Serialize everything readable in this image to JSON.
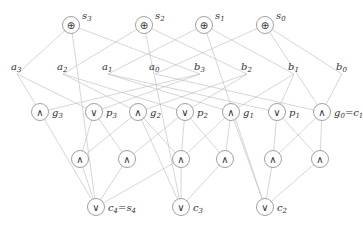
{
  "diagram": {
    "colors": {
      "wire": "#bbbbbb",
      "gate_stroke": "#888888",
      "text": "#333333"
    },
    "gate_symbols": {
      "xor": "⊕",
      "and": "∧",
      "or": "∨"
    },
    "xor_gates": [
      {
        "id": "s3",
        "x": 71,
        "y": 25,
        "label": "s",
        "sub": "3"
      },
      {
        "id": "s2",
        "x": 144,
        "y": 25,
        "label": "s",
        "sub": "2"
      },
      {
        "id": "s1",
        "x": 204,
        "y": 25,
        "label": "s",
        "sub": "1"
      },
      {
        "id": "s0",
        "x": 265,
        "y": 25,
        "label": "s",
        "sub": "0"
      }
    ],
    "inputs": [
      {
        "id": "a3",
        "x": 17,
        "y": 70,
        "label": "a",
        "sub": "3"
      },
      {
        "id": "a2",
        "x": 63,
        "y": 70,
        "label": "a",
        "sub": "2"
      },
      {
        "id": "a1",
        "x": 108,
        "y": 70,
        "label": "a",
        "sub": "1"
      },
      {
        "id": "a0",
        "x": 155,
        "y": 70,
        "label": "a",
        "sub": "0"
      },
      {
        "id": "b3",
        "x": 200,
        "y": 70,
        "label": "b",
        "sub": "3"
      },
      {
        "id": "b2",
        "x": 247,
        "y": 70,
        "label": "b",
        "sub": "2"
      },
      {
        "id": "b1",
        "x": 294,
        "y": 70,
        "label": "b",
        "sub": "1"
      },
      {
        "id": "b0",
        "x": 342,
        "y": 70,
        "label": "b",
        "sub": "0"
      }
    ],
    "gp_gates": [
      {
        "id": "g3",
        "type": "and",
        "x": 40,
        "y": 112,
        "label": "g",
        "sub": "3"
      },
      {
        "id": "p3",
        "type": "or",
        "x": 94,
        "y": 112,
        "label": "p",
        "sub": "3"
      },
      {
        "id": "g2",
        "type": "and",
        "x": 138,
        "y": 112,
        "label": "g",
        "sub": "2"
      },
      {
        "id": "p2",
        "type": "or",
        "x": 185,
        "y": 112,
        "label": "p",
        "sub": "2"
      },
      {
        "id": "g1",
        "type": "and",
        "x": 231,
        "y": 112,
        "label": "g",
        "sub": "1"
      },
      {
        "id": "p1",
        "type": "or",
        "x": 277,
        "y": 112,
        "label": "p",
        "sub": "1"
      },
      {
        "id": "g0",
        "type": "and",
        "x": 322,
        "y": 112,
        "label": "g",
        "sub": "0",
        "suffix": "=c",
        "suffix_sub": "1"
      }
    ],
    "and_row": [
      {
        "id": "n1",
        "type": "and",
        "x": 80,
        "y": 159
      },
      {
        "id": "n2",
        "type": "and",
        "x": 127,
        "y": 159
      },
      {
        "id": "n3",
        "type": "and",
        "x": 181,
        "y": 159
      },
      {
        "id": "n4",
        "type": "and",
        "x": 225,
        "y": 159
      },
      {
        "id": "n5",
        "type": "and",
        "x": 273,
        "y": 159
      },
      {
        "id": "n6",
        "type": "and",
        "x": 320,
        "y": 159
      }
    ],
    "carry_gates": [
      {
        "id": "c4",
        "type": "or",
        "x": 96,
        "y": 207,
        "label": "c",
        "sub": "4",
        "suffix": "=s",
        "suffix_sub": "4"
      },
      {
        "id": "c3",
        "type": "or",
        "x": 181,
        "y": 207,
        "label": "c",
        "sub": "3"
      },
      {
        "id": "c2",
        "type": "or",
        "x": 265,
        "y": 207,
        "label": "c",
        "sub": "2"
      }
    ],
    "wires": [
      [
        "a3",
        "s3"
      ],
      [
        "b3",
        "s3"
      ],
      [
        "a2",
        "s2"
      ],
      [
        "b2",
        "s2"
      ],
      [
        "a1",
        "s1"
      ],
      [
        "b1",
        "s1"
      ],
      [
        "a0",
        "s0"
      ],
      [
        "b0",
        "s0"
      ],
      [
        "c4",
        "s3"
      ],
      [
        "c3",
        "s2"
      ],
      [
        "c2",
        "s1"
      ],
      [
        "g0",
        "s0"
      ],
      [
        "a3",
        "g3"
      ],
      [
        "a3",
        "p3"
      ],
      [
        "b3",
        "g3"
      ],
      [
        "b3",
        "p3"
      ],
      [
        "a2",
        "g2"
      ],
      [
        "a2",
        "p2"
      ],
      [
        "b2",
        "g2"
      ],
      [
        "b2",
        "p2"
      ],
      [
        "a1",
        "g1"
      ],
      [
        "a1",
        "p1"
      ],
      [
        "b1",
        "g1"
      ],
      [
        "b1",
        "p1"
      ],
      [
        "a0",
        "g0"
      ],
      [
        "b0",
        "g0"
      ],
      [
        "p3",
        "n1"
      ],
      [
        "g2",
        "n1"
      ],
      [
        "p3",
        "n2"
      ],
      [
        "p2",
        "n2"
      ],
      [
        "g2",
        "n3"
      ],
      [
        "p2",
        "n3"
      ],
      [
        "g1",
        "n3"
      ],
      [
        "p2",
        "n4"
      ],
      [
        "g1",
        "n4"
      ],
      [
        "p1",
        "n5"
      ],
      [
        "g0",
        "n5"
      ],
      [
        "p1",
        "n6"
      ],
      [
        "g0",
        "n6"
      ],
      [
        "g3",
        "c4"
      ],
      [
        "n1",
        "c4"
      ],
      [
        "n2",
        "c4"
      ],
      [
        "n3",
        "c4"
      ],
      [
        "g2",
        "c3"
      ],
      [
        "n3",
        "c3"
      ],
      [
        "n4",
        "c3"
      ],
      [
        "g1",
        "c2"
      ],
      [
        "n5",
        "c2"
      ],
      [
        "n6",
        "c2"
      ]
    ]
  }
}
